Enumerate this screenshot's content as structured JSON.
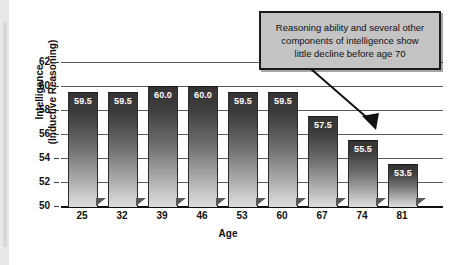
{
  "chart_data": {
    "type": "bar",
    "title": "",
    "subtitle": "",
    "xlabel": "Age",
    "ylabel": "Intelligence (Inductive Reasoning)",
    "ylabel_lines": [
      "Intelligence",
      "(Inductive Reasoning)"
    ],
    "categories": [
      "25",
      "32",
      "39",
      "46",
      "53",
      "60",
      "67",
      "74",
      "81"
    ],
    "values": [
      59.5,
      59.5,
      60.0,
      60.0,
      59.5,
      59.5,
      57.5,
      55.5,
      53.5
    ],
    "value_labels": [
      "59.5",
      "59.5",
      "60.0",
      "60.0",
      "59.5",
      "59.5",
      "57.5",
      "55.5",
      "53.5"
    ],
    "ylim": [
      50,
      62
    ],
    "yticks": [
      62,
      60,
      58,
      56,
      54,
      52,
      50
    ],
    "ytick_labels": [
      "62",
      "60",
      "58",
      "56",
      "54",
      "52",
      "50"
    ],
    "grid": true,
    "legend": "none",
    "annotations": [
      {
        "name": "callout",
        "lines": [
          "Reasoning ability and several other",
          "components of intelligence show",
          "little decline before age 70"
        ],
        "points_to_category": "74"
      }
    ],
    "colors": {
      "bar_top": "#343434",
      "bar_bottom": "#dcdcdc",
      "axis": "#111111",
      "gridline": "#5a5a5a",
      "callout_bg": "#c4c4c4",
      "callout_border": "#1a1a1a",
      "value_text": "#ffffff",
      "background": "#ffffff"
    }
  }
}
